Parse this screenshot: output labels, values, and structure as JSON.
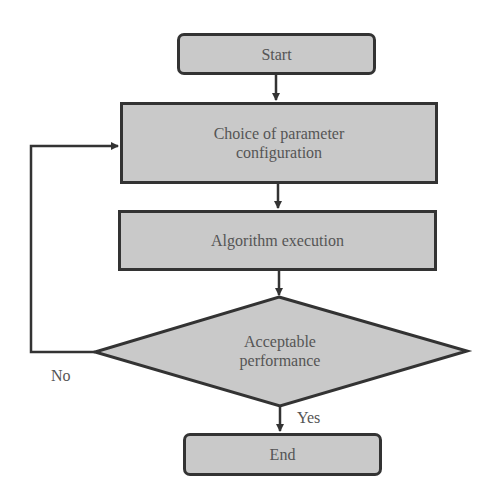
{
  "diagram": {
    "type": "flowchart",
    "nodes": {
      "start": {
        "label": "Start",
        "shape": "rounded-rectangle"
      },
      "choice": {
        "label": "Choice of parameter configuration",
        "line1": "Choice of parameter",
        "line2": "configuration",
        "shape": "rectangle"
      },
      "execution": {
        "label": "Algorithm execution",
        "shape": "rectangle"
      },
      "decision": {
        "label": "Acceptable performance",
        "line1": "Acceptable",
        "line2": "performance",
        "shape": "diamond"
      },
      "end": {
        "label": "End",
        "shape": "rounded-rectangle"
      }
    },
    "edges": [
      {
        "from": "start",
        "to": "choice",
        "label": ""
      },
      {
        "from": "choice",
        "to": "execution",
        "label": ""
      },
      {
        "from": "execution",
        "to": "decision",
        "label": ""
      },
      {
        "from": "decision",
        "to": "end",
        "label": "Yes"
      },
      {
        "from": "decision",
        "to": "choice",
        "label": "No"
      }
    ],
    "labels": {
      "yes": "Yes",
      "no": "No"
    },
    "colors": {
      "fill": "#c9c9c9",
      "stroke": "#333333",
      "text": "#555555"
    }
  }
}
